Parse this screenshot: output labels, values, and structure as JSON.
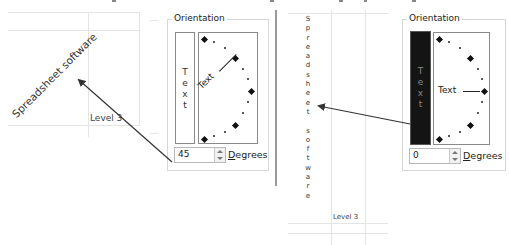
{
  "left_example": {
    "rotated_cell_text": "Spreadsheet software",
    "adjacent_cell_text": "Level 3",
    "orientation_dialog": {
      "legend": "Orientation",
      "vertical_text_letters": [
        "T",
        "e",
        "x",
        "t"
      ],
      "vertical_text_selected": false,
      "dial_text": "Text",
      "dial_angle_degrees": 45,
      "degrees_value": "45",
      "degrees_label_underlined": "D",
      "degrees_label_rest": "egrees"
    }
  },
  "right_example": {
    "stacked_cell_letters": [
      "S",
      "p",
      "r",
      "e",
      "a",
      "d",
      "s",
      "h",
      "e",
      "e",
      "t",
      " ",
      "s",
      "o",
      "f",
      "t",
      "w",
      "a",
      "r",
      "e"
    ],
    "adjacent_cell_text": "Level 3",
    "orientation_dialog": {
      "legend": "Orientation",
      "vertical_text_letters": [
        "T",
        "e",
        "x",
        "t"
      ],
      "vertical_text_selected": true,
      "dial_text": "Text",
      "dial_angle_degrees": 0,
      "degrees_value": "0",
      "degrees_label_underlined": "D",
      "degrees_label_rest": "egrees"
    }
  },
  "colors": {
    "selected_vertical_box": "#141414",
    "arrow": "#333333",
    "divider": "#9a9a9a"
  }
}
